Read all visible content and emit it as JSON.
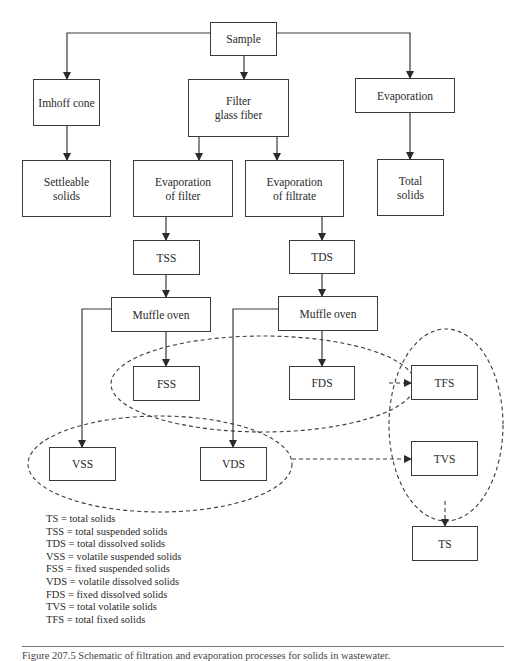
{
  "nodes": {
    "sample": "Sample",
    "imhoff_cone": "Imhoff cone",
    "filter_glass_fiber": "Filter\nglass fiber",
    "evaporation": "Evaporation",
    "settleable_solids": "Settleable\nsolids",
    "evaporation_of_filter": "Evaporation\nof filter",
    "evaporation_of_filtrate": "Evaporation\nof filtrate",
    "total_solids": "Total\nsolids",
    "tss": "TSS",
    "tds": "TDS",
    "muffle_oven_left": "Muffle oven",
    "muffle_oven_right": "Muffle oven",
    "fss": "FSS",
    "fds": "FDS",
    "tfs": "TFS",
    "vss": "VSS",
    "vds": "VDS",
    "tvs": "TVS",
    "ts": "TS"
  },
  "legend": [
    "TS = total solids",
    "TSS = total suspended solids",
    "TDS = total dissolved solids",
    "VSS = volatile suspended solids",
    "FSS = fixed suspended solids",
    "VDS = volatile dissolved solids",
    "FDS = fixed dissolved solids",
    "TVS = total volatile solids",
    "TFS = total fixed solids"
  ],
  "caption": "Figure 207.5  Schematic of filtration and evaporation processes for solids in wastewater."
}
